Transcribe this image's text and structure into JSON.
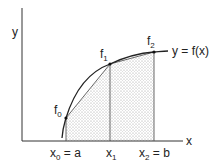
{
  "figure": {
    "axes": {
      "x_label": "x",
      "y_label": "y"
    },
    "curve_label": "y = f(x)",
    "points": [
      {
        "name": "f",
        "sub": "0"
      },
      {
        "name": "f",
        "sub": "1"
      },
      {
        "name": "f",
        "sub": "2"
      }
    ],
    "x_ticks": [
      {
        "name": "x",
        "sub": "0",
        "suffix": " = a"
      },
      {
        "name": "x",
        "sub": "1",
        "suffix": ""
      },
      {
        "name": "x",
        "sub": "2",
        "suffix": " = b"
      }
    ],
    "colors": {
      "line": "#222222",
      "shading": "#b8b8b8",
      "background": "#ffffff"
    }
  }
}
